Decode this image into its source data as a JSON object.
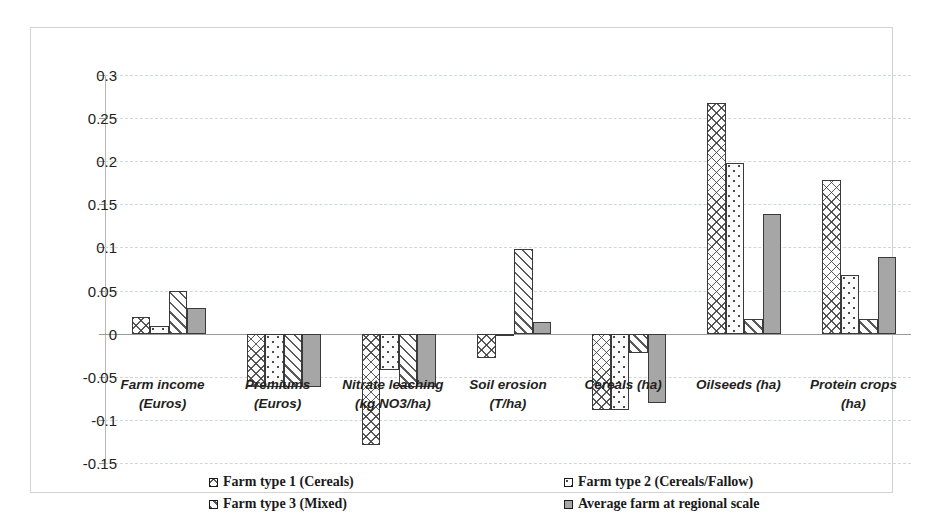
{
  "chart_data": {
    "type": "bar",
    "title": "",
    "xlabel": "",
    "ylabel": "",
    "ylim": [
      -0.15,
      0.3
    ],
    "ytick_step": 0.05,
    "yticks": [
      "0.3",
      "0.25",
      "0.2",
      "0.15",
      "0.1",
      "0.05",
      "0",
      "-0.05",
      "-0.1",
      "-0.15"
    ],
    "grid": true,
    "legend_position": "bottom",
    "categories": [
      "Farm income (Euros)",
      "Premiums (Euros)",
      "Nitrate leaching (kg NO3/ha)",
      "Soil erosion (T/ha)",
      "Cereals (ha)",
      "Oilseeds (ha)",
      "Protein crops (ha)"
    ],
    "category_lines": [
      [
        "Farm income",
        "(Euros)"
      ],
      [
        "Premiums",
        "(Euros)"
      ],
      [
        "Nitrate leaching",
        "(kg NO3/ha)"
      ],
      [
        "Soil erosion",
        "(T/ha)"
      ],
      [
        "Cereals (ha)"
      ],
      [
        "Oilseeds (ha)"
      ],
      [
        "Protein crops",
        "(ha)"
      ]
    ],
    "series": [
      {
        "name": "Farm type 1 (Cereals)",
        "pattern": "cross-hatch",
        "values": [
          0.019,
          -0.062,
          -0.129,
          -0.028,
          -0.088,
          0.267,
          0.178
        ]
      },
      {
        "name": "Farm type 2 (Cereals/Fallow)",
        "pattern": "dots",
        "values": [
          0.009,
          -0.062,
          -0.042,
          0.0,
          -0.088,
          0.198,
          0.068
        ]
      },
      {
        "name": "Farm type 3 (Mixed)",
        "pattern": "diagonal-lines",
        "values": [
          0.05,
          -0.062,
          -0.062,
          0.098,
          -0.022,
          0.017,
          0.017
        ]
      },
      {
        "name": "Average farm at regional scale",
        "pattern": "solid-gray",
        "values": [
          0.03,
          -0.062,
          -0.062,
          0.013,
          -0.08,
          0.139,
          0.089
        ]
      }
    ]
  },
  "colors": {
    "series_fill_gray": "#a6a6a6",
    "bar_border": "#3a3a3a",
    "gridline": "#cfd6e2",
    "axis": "#9a9a9a",
    "text": "#231f20",
    "frame": "#d2d2d2"
  }
}
